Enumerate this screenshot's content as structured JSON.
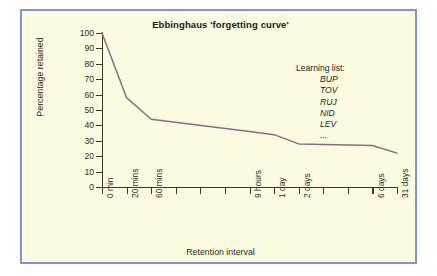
{
  "figure": {
    "title": "Ebbinghaus 'forgetting curve'",
    "background_color": "#fbfbe2",
    "border_color": "#8096cc",
    "curve_color": "#8d6a86",
    "axis_color": "#3b3b27"
  },
  "annotation": {
    "heading": "Learning list:",
    "items": [
      "BUP",
      "TOV",
      "RUJ",
      "NID",
      "LEV",
      "..."
    ]
  },
  "chart_data": {
    "type": "line",
    "title": "Ebbinghaus 'forgetting curve'",
    "xlabel": "Retention interval",
    "ylabel": "Percentage retained",
    "ylim": [
      0,
      100
    ],
    "ytick_labels": [
      "0",
      "10",
      "20",
      "30",
      "40",
      "50",
      "60",
      "70",
      "80",
      "90",
      "100"
    ],
    "ytick_values": [
      0,
      10,
      20,
      30,
      40,
      50,
      60,
      70,
      80,
      90,
      100
    ],
    "grid": false,
    "legend": "none",
    "xtick_slots": 13,
    "xtick_labels": [
      "0 min",
      "20 mins",
      "60 mins",
      "",
      "",
      "",
      "9 hours",
      "1 day",
      "2 days",
      "",
      "",
      "6 days",
      "31 days"
    ],
    "categories": [
      "0 min",
      "20 mins",
      "60 mins",
      "9 hours",
      "1 day",
      "2 days",
      "6 days",
      "31 days"
    ],
    "series": [
      {
        "name": "Percentage retained",
        "points": [
          {
            "slot": 0,
            "x": "0 min",
            "y": 100
          },
          {
            "slot": 1,
            "x": "20 mins",
            "y": 58
          },
          {
            "slot": 2,
            "x": "60 mins",
            "y": 44
          },
          {
            "slot": 6,
            "x": "9 hours",
            "y": 36
          },
          {
            "slot": 7,
            "x": "1 day",
            "y": 34
          },
          {
            "slot": 8,
            "x": "2 days",
            "y": 28
          },
          {
            "slot": 11,
            "x": "6 days",
            "y": 27
          },
          {
            "slot": 12,
            "x": "31 days",
            "y": 22
          }
        ],
        "values": [
          100,
          58,
          44,
          36,
          34,
          28,
          27,
          22
        ]
      }
    ]
  }
}
